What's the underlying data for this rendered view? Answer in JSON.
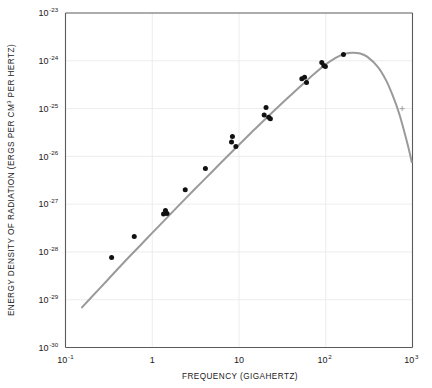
{
  "chart_data": {
    "type": "scatter",
    "title": "",
    "xlabel": "FREQUENCY (GIGAHERTZ)",
    "ylabel_parts": {
      "pre": "ENERGY DENSITY OF RADIATION (ERGS PER CM",
      "sup": "3",
      "post": " PER HERTZ)"
    },
    "ylabel": "ENERGY DENSITY OF RADIATION (ERGS PER CM3 PER HERTZ)",
    "xscale": "log",
    "yscale": "log",
    "xlim": [
      0.1,
      1000
    ],
    "ylim": [
      1e-30,
      1e-23
    ],
    "grid": true,
    "legend": "none",
    "xticks": [
      {
        "value": 0.1,
        "mantissa": "10",
        "exponent": "-1"
      },
      {
        "value": 1,
        "mantissa": "1",
        "exponent": ""
      },
      {
        "value": 10,
        "mantissa": "10",
        "exponent": ""
      },
      {
        "value": 100,
        "mantissa": "10",
        "exponent": "2"
      },
      {
        "value": 1000,
        "mantissa": "10",
        "exponent": "3"
      }
    ],
    "yticks": [
      {
        "value": 1e-23,
        "mantissa": "10",
        "exponent": "-23"
      },
      {
        "value": 1e-24,
        "mantissa": "10",
        "exponent": "-24"
      },
      {
        "value": 1e-25,
        "mantissa": "10",
        "exponent": "-25"
      },
      {
        "value": 1e-26,
        "mantissa": "10",
        "exponent": "-26"
      },
      {
        "value": 1e-27,
        "mantissa": "10",
        "exponent": "-27"
      },
      {
        "value": 1e-28,
        "mantissa": "10",
        "exponent": "-28"
      },
      {
        "value": 1e-29,
        "mantissa": "10",
        "exponent": "-29"
      },
      {
        "value": 1e-30,
        "mantissa": "10",
        "exponent": "-30"
      }
    ],
    "series": [
      {
        "name": "blackbody-curve",
        "type": "line",
        "color": "#9a9a9a",
        "points": [
          [
            0.155,
            6.9e-30
          ],
          [
            0.2,
            1.14e-29
          ],
          [
            0.3,
            2.5e-29
          ],
          [
            0.4,
            4.4e-29
          ],
          [
            0.55,
            8.1e-29
          ],
          [
            0.75,
            1.45e-28
          ],
          [
            1.0,
            2.5e-28
          ],
          [
            1.4,
            4.7e-28
          ],
          [
            2.0,
            9.2e-28
          ],
          [
            3.0,
            1.95e-27
          ],
          [
            4.0,
            3.3e-27
          ],
          [
            5.5,
            5.9e-27
          ],
          [
            7.5,
            1.04e-26
          ],
          [
            10.0,
            1.75e-26
          ],
          [
            14.0,
            3.2e-26
          ],
          [
            20.0,
            6e-26
          ],
          [
            30.0,
            1.2e-25
          ],
          [
            40.0,
            1.95e-25
          ],
          [
            55.0,
            3.3e-25
          ],
          [
            75.0,
            5.5e-25
          ],
          [
            100.0,
            8.4e-25
          ],
          [
            130.0,
            1.15e-24
          ],
          [
            160.0,
            1.38e-24
          ],
          [
            200.0,
            1.48e-24
          ],
          [
            250.0,
            1.42e-24
          ],
          [
            300.0,
            1.22e-24
          ],
          [
            400.0,
            7.4e-25
          ],
          [
            500.0,
            3.8e-25
          ],
          [
            600.0,
            1.75e-25
          ],
          [
            700.0,
            8e-26
          ],
          [
            800.0,
            3.4e-26
          ],
          [
            900.0,
            1.5e-26
          ],
          [
            980.0,
            7.6e-27
          ]
        ]
      },
      {
        "name": "measured-points",
        "type": "scatter",
        "color": "#111111",
        "marker": "circle",
        "points": [
          [
            0.34,
            7.6e-29
          ],
          [
            0.62,
            2.1e-28
          ],
          [
            1.35,
            6.2e-28
          ],
          [
            1.42,
            7.4e-28
          ],
          [
            1.48,
            6.4e-28
          ],
          [
            2.4,
            2e-27
          ],
          [
            4.1,
            5.6e-27
          ],
          [
            8.2,
            2e-26
          ],
          [
            8.4,
            2.6e-26
          ],
          [
            9.2,
            1.6e-26
          ],
          [
            19.5,
            7.3e-26
          ],
          [
            20.5,
            1.05e-25
          ],
          [
            22.0,
            6.6e-26
          ],
          [
            23.0,
            6.1e-26
          ],
          [
            53.0,
            4.2e-25
          ],
          [
            57.0,
            4.5e-25
          ],
          [
            60.0,
            3.5e-25
          ],
          [
            90.0,
            9.2e-25
          ],
          [
            95.0,
            8e-25
          ],
          [
            99.0,
            7.6e-25
          ],
          [
            160.0,
            1.36e-24
          ]
        ]
      }
    ],
    "annotations": [
      {
        "name": "right-edge-marker",
        "x": 760.0,
        "y": 1e-25
      }
    ]
  }
}
